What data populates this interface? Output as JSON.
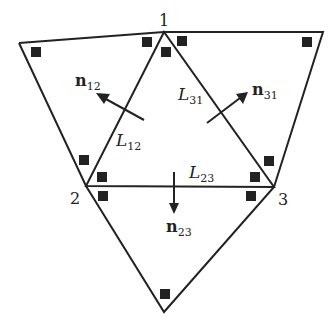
{
  "diagram": {
    "vertices": [
      {
        "id": "1",
        "label": "1"
      },
      {
        "id": "2",
        "label": "2"
      },
      {
        "id": "3",
        "label": "3"
      }
    ],
    "edges": [
      {
        "name": "L",
        "sub": "12"
      },
      {
        "name": "L",
        "sub": "23"
      },
      {
        "name": "L",
        "sub": "31"
      }
    ],
    "normals": [
      {
        "name": "n",
        "sub": "12"
      },
      {
        "name": "n",
        "sub": "23"
      },
      {
        "name": "n",
        "sub": "31"
      }
    ],
    "colors": {
      "line": "#222222",
      "background": "#ffffff"
    }
  }
}
